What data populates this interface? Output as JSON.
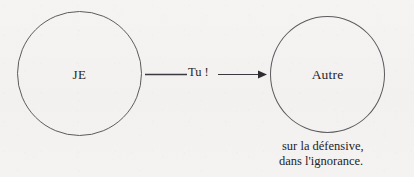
{
  "diagram": {
    "background_color": "#f4f3f1",
    "stroke_color": "#5b5b5e",
    "text_color": "#26262a",
    "nodes": [
      {
        "id": "je",
        "label": "JE",
        "shape": "circle"
      },
      {
        "id": "autre",
        "label": "Autre",
        "shape": "circle"
      }
    ],
    "edge": {
      "from": "je",
      "to": "autre",
      "label": "Tu !",
      "arrowhead": "filled-triangle",
      "direction": "right"
    },
    "caption": {
      "line1": "sur la défensive,",
      "line2": "dans l'ignorance."
    }
  }
}
